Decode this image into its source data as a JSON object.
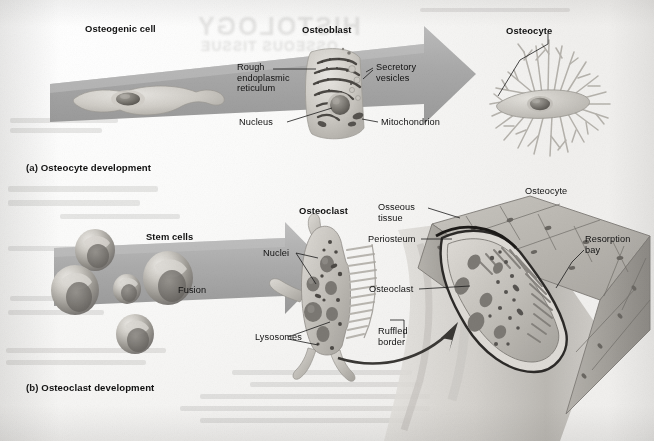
{
  "figure": {
    "title_ghost_1": "HISTOLOGY",
    "title_ghost_2": "OSSEOUS TISSUE",
    "background_hex": "#f3f2f0",
    "arrow_hex": "#a9a9a9",
    "ink_hex": "#111111"
  },
  "panel_a": {
    "caption": "(a) Osteocyte development",
    "stage_1_label": "Osteogenic cell",
    "stage_2_label": "Osteoblast",
    "stage_3_label": "Osteocyte",
    "callouts": [
      {
        "id": "rough-er",
        "text": "Rough\nendoplasmic\nreticulum"
      },
      {
        "id": "secretory",
        "text": "Secretory\nvesicles"
      },
      {
        "id": "nucleus",
        "text": "Nucleus"
      },
      {
        "id": "mitochondrion",
        "text": "Mitochondrion"
      }
    ]
  },
  "panel_b": {
    "caption": "(b) Osteoclast development",
    "stage_1_label": "Stem cells",
    "process_label": "Fusion",
    "stage_2_label": "Osteoclast",
    "callouts": [
      {
        "id": "nuclei",
        "text": "Nuclei"
      },
      {
        "id": "lysosomes",
        "text": "Lysosomes"
      },
      {
        "id": "osseous-tissue",
        "text": "Osseous\ntissue"
      },
      {
        "id": "periosteum",
        "text": "Periosteum"
      },
      {
        "id": "osteoclast-bone",
        "text": "Osteoclast"
      },
      {
        "id": "ruffled-border",
        "text": "Ruffled\nborder"
      },
      {
        "id": "osteocyte-bone",
        "text": "Osteocyte"
      },
      {
        "id": "resorption-bay",
        "text": "Resorption\nbay"
      }
    ]
  }
}
